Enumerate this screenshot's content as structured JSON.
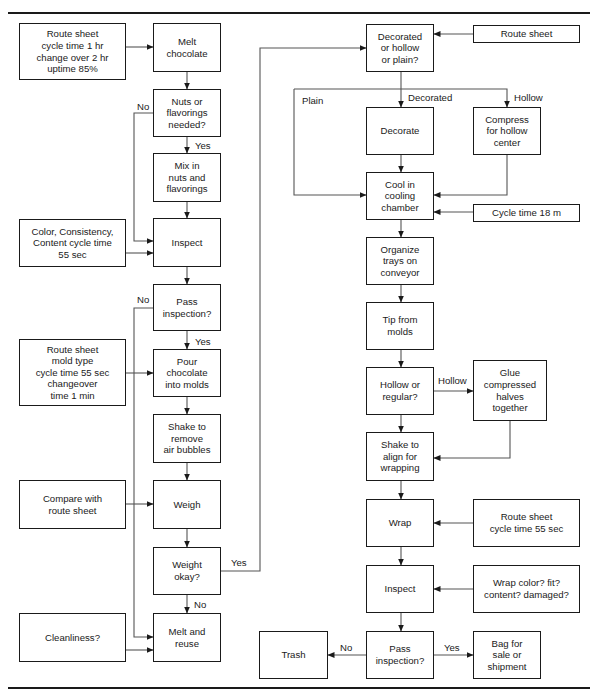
{
  "diagram": {
    "type": "flowchart",
    "left_column": {
      "inputs": [
        {
          "id": "in_route1",
          "text": "Route sheet\ncycle time 1 hr\nchange over 2 hr\nuptime 85%"
        },
        {
          "id": "in_color",
          "text": "Color, Consistency,\nContent cycle time\n55 sec"
        },
        {
          "id": "in_route2",
          "text": "Route sheet\nmold type\ncycle time 55 sec\nchangeover\ntime 1 min"
        },
        {
          "id": "in_compare",
          "text": "Compare with\nroute sheet"
        },
        {
          "id": "in_clean",
          "text": "Cleanliness?"
        }
      ],
      "steps": [
        {
          "id": "melt",
          "text": "Melt\nchocolate"
        },
        {
          "id": "nuts_q",
          "text": "Nuts or\nflavorings\nneeded?"
        },
        {
          "id": "mix",
          "text": "Mix in\nnuts and\nflavorings"
        },
        {
          "id": "inspect1",
          "text": "Inspect"
        },
        {
          "id": "pass1_q",
          "text": "Pass\ninspection?"
        },
        {
          "id": "pour",
          "text": "Pour\nchocolate\ninto molds"
        },
        {
          "id": "shake1",
          "text": "Shake to\nremove\nair bubbles"
        },
        {
          "id": "weigh",
          "text": "Weigh"
        },
        {
          "id": "weight_q",
          "text": "Weight\nokay?"
        },
        {
          "id": "reuse",
          "text": "Melt and\nreuse"
        }
      ]
    },
    "right_column": {
      "inputs": [
        {
          "id": "in_route3",
          "text": "Route sheet"
        },
        {
          "id": "in_cycle18",
          "text": "Cycle time 18 m"
        },
        {
          "id": "in_route4",
          "text": "Route sheet\ncycle time 55 sec"
        },
        {
          "id": "in_wrapq",
          "text": "Wrap color? fit?\ncontent? damaged?"
        }
      ],
      "steps": [
        {
          "id": "deco_q",
          "text": "Decorated\nor hollow\nor plain?"
        },
        {
          "id": "decorate",
          "text": "Decorate"
        },
        {
          "id": "compress",
          "text": "Compress\nfor hollow\ncenter"
        },
        {
          "id": "cool",
          "text": "Cool in\ncooling\nchamber"
        },
        {
          "id": "organize",
          "text": "Organize\ntrays on\nconveyor"
        },
        {
          "id": "tip",
          "text": "Tip from\nmolds"
        },
        {
          "id": "hollow_q",
          "text": "Hollow or\nregular?"
        },
        {
          "id": "glue",
          "text": "Glue\ncompressed\nhalves\ntogether"
        },
        {
          "id": "shake2",
          "text": "Shake to\nalign for\nwrapping"
        },
        {
          "id": "wrap",
          "text": "Wrap"
        },
        {
          "id": "inspect2",
          "text": "Inspect"
        },
        {
          "id": "pass2_q",
          "text": "Pass\ninspection?"
        },
        {
          "id": "trash",
          "text": "Trash"
        },
        {
          "id": "bag",
          "text": "Bag for\nsale or\nshipment"
        }
      ]
    },
    "edge_labels": {
      "nuts_no": "No",
      "nuts_yes": "Yes",
      "pass1_no": "No",
      "pass1_yes": "Yes",
      "weight_yes": "Yes",
      "weight_no": "No",
      "plain": "Plain",
      "decorated": "Decorated",
      "hollow1": "Hollow",
      "hollow2": "Hollow",
      "pass2_no": "No",
      "pass2_yes": "Yes"
    },
    "edges": [
      [
        "in_route1",
        "melt"
      ],
      [
        "melt",
        "nuts_q"
      ],
      [
        "nuts_q",
        "mix",
        "Yes"
      ],
      [
        "nuts_q",
        "inspect1",
        "No"
      ],
      [
        "mix",
        "inspect1"
      ],
      [
        "in_color",
        "inspect1"
      ],
      [
        "inspect1",
        "pass1_q"
      ],
      [
        "pass1_q",
        "pour",
        "Yes"
      ],
      [
        "pass1_q",
        "reuse",
        "No"
      ],
      [
        "in_route2",
        "pour"
      ],
      [
        "pour",
        "shake1"
      ],
      [
        "shake1",
        "weigh"
      ],
      [
        "in_compare",
        "weigh"
      ],
      [
        "weigh",
        "weight_q"
      ],
      [
        "weight_q",
        "reuse",
        "No"
      ],
      [
        "in_clean",
        "reuse"
      ],
      [
        "weight_q",
        "deco_q",
        "Yes"
      ],
      [
        "in_route3",
        "deco_q"
      ],
      [
        "deco_q",
        "decorate",
        "Decorated"
      ],
      [
        "deco_q",
        "compress",
        "Hollow"
      ],
      [
        "deco_q",
        "cool",
        "Plain"
      ],
      [
        "decorate",
        "cool"
      ],
      [
        "compress",
        "cool"
      ],
      [
        "in_cycle18",
        "cool"
      ],
      [
        "cool",
        "organize"
      ],
      [
        "organize",
        "tip"
      ],
      [
        "tip",
        "hollow_q"
      ],
      [
        "hollow_q",
        "glue",
        "Hollow"
      ],
      [
        "hollow_q",
        "shake2"
      ],
      [
        "glue",
        "shake2"
      ],
      [
        "shake2",
        "wrap"
      ],
      [
        "in_route4",
        "wrap"
      ],
      [
        "wrap",
        "inspect2"
      ],
      [
        "in_wrapq",
        "inspect2"
      ],
      [
        "inspect2",
        "pass2_q"
      ],
      [
        "pass2_q",
        "trash",
        "No"
      ],
      [
        "pass2_q",
        "bag",
        "Yes"
      ]
    ]
  }
}
